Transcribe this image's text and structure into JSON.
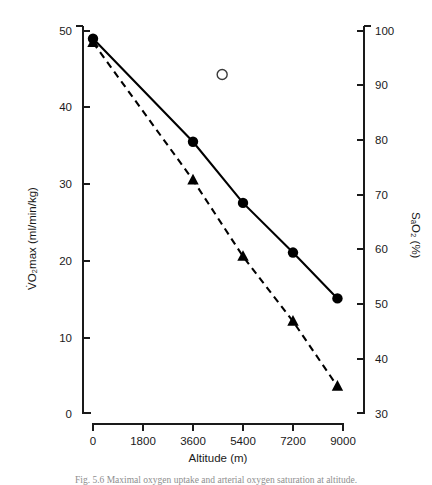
{
  "figure": {
    "caption": "Fig. 5.6  Maximal oxygen uptake and arterial oxygen saturation at altitude."
  },
  "chart_data": {
    "type": "line",
    "title": "",
    "xlabel": "Altitude (m)",
    "ylabel": "V̇O₂max (ml/min/kg)",
    "ylabel_right": "SₐO₂ (%)",
    "xlim": [
      0,
      9000
    ],
    "ylim": [
      0,
      50
    ],
    "ylim_right": [
      30,
      100
    ],
    "grid": false,
    "legend": "none",
    "xticks": [
      0,
      1800,
      3600,
      5400,
      7200,
      9000
    ],
    "xtick_labels": [
      "0",
      "1800",
      "3600",
      "5400",
      "7200",
      "9000"
    ],
    "yticks": [
      0,
      10,
      20,
      30,
      40,
      50
    ],
    "ytick_labels": [
      "0",
      "10",
      "20",
      "30",
      "40",
      "50"
    ],
    "yticks_right": [
      30,
      40,
      50,
      60,
      70,
      80,
      90,
      100
    ],
    "ytick_labels_right": [
      "30",
      "40",
      "50",
      "60",
      "70",
      "80",
      "90",
      "100"
    ],
    "series": [
      {
        "name": "VO2max",
        "axis": "left",
        "marker": "filled-circle",
        "line_style": "solid",
        "color": "#000000",
        "x": [
          0,
          3600,
          5400,
          7200,
          8800
        ],
        "values": [
          49.0,
          35.5,
          27.5,
          21.0,
          15.0
        ]
      },
      {
        "name": "SaO2",
        "axis": "right",
        "marker": "filled-triangle",
        "line_style": "dashed",
        "color": "#000000",
        "x": [
          0,
          3600,
          5400,
          7200,
          8800
        ],
        "values": [
          98.0,
          73.0,
          59.5,
          48.0,
          34.5
        ],
        "values_left_scale": [
          48.5,
          30.5,
          20.5,
          12.0,
          3.5
        ]
      },
      {
        "name": "isolated-point",
        "axis": "right",
        "marker": "open-circle",
        "line_style": "none",
        "color": "#3a3a3a",
        "x": [
          4650
        ],
        "values": [
          92.0
        ],
        "values_left_scale": [
          44.3
        ]
      }
    ]
  }
}
